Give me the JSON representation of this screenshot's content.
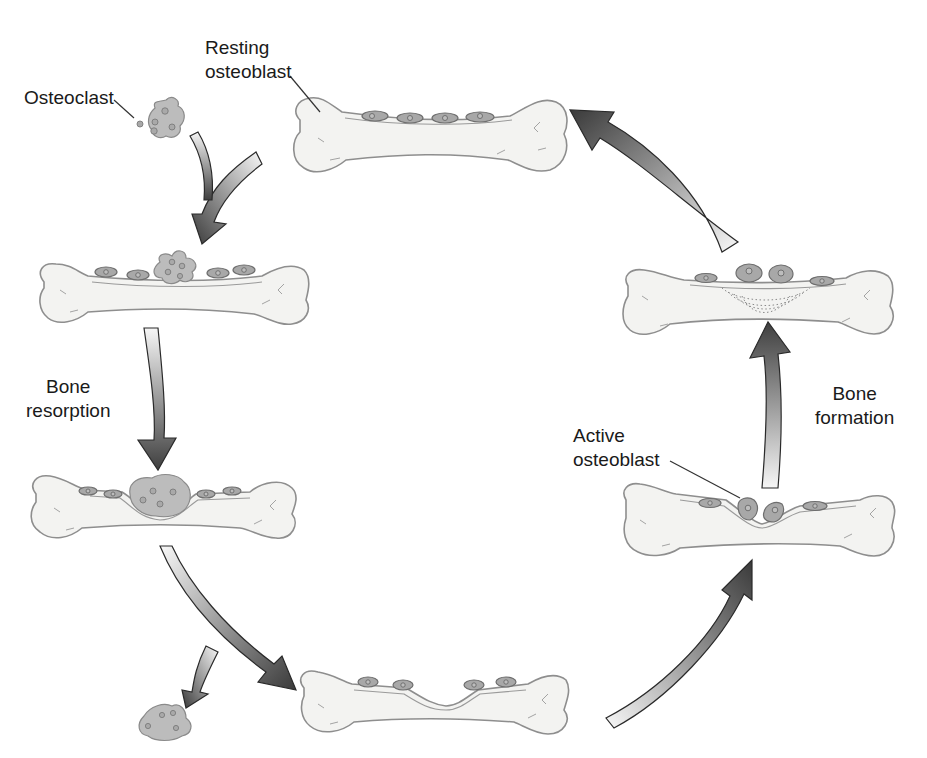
{
  "labels": {
    "osteoclast": "Osteoclast",
    "resting_osteoblast_line1": "Resting",
    "resting_osteoblast_line2": "osteoblast",
    "bone_resorption_line1": "Bone",
    "bone_resorption_line2": "resorption",
    "active_osteoblast_line1": "Active",
    "active_osteoblast_line2": "osteoblast",
    "bone_formation_line1": "Bone",
    "bone_formation_line2": "formation"
  },
  "stages": [
    {
      "id": "resting",
      "description": "Resting bone surface lined with resting osteoblasts"
    },
    {
      "id": "osteoclast-attach",
      "description": "Osteoclast attaches to bone surface"
    },
    {
      "id": "resorption",
      "description": "Osteoclast resorbs bone, forming a pit"
    },
    {
      "id": "reversal",
      "description": "Osteoclast detaches, leaving a resorption cavity"
    },
    {
      "id": "active-formation",
      "description": "Active osteoblasts fill the cavity"
    },
    {
      "id": "new-bone",
      "description": "New bone laid down in layers"
    }
  ],
  "colors": {
    "bone_fill": "#f3f3f1",
    "bone_stroke": "#8e8e8e",
    "cell_fill": "#a8a8a8",
    "arrow_dark": "#4a4a4a",
    "arrow_light": "#f4f4f4",
    "text": "#1a1a1a"
  }
}
